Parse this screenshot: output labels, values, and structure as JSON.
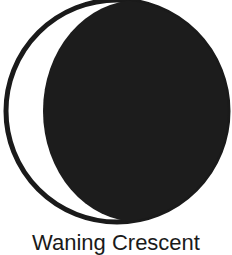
{
  "figure": {
    "type": "moon-phase-icon",
    "phase_label": "Waning Crescent",
    "colors": {
      "background": "#ffffff",
      "shadow": "#1c1c1c",
      "outline": "#1a1a1a",
      "lit": "#ffffff"
    }
  }
}
